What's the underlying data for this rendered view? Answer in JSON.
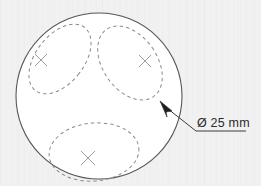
{
  "drawing": {
    "title": "Circular plate with three dashed pocket outlines",
    "background_color": "#f1f1f1",
    "line_color": "#555555",
    "dashed_color": "#8a8a8a",
    "center_mark_color": "#9a9a9a",
    "leader_color": "#3a3a3a",
    "text_color": "#2b2b2b"
  },
  "outer_circle": {
    "name": "plate-outline",
    "cx": 99,
    "cy": 96,
    "r": 83,
    "style": "solid"
  },
  "features": [
    {
      "id": "pocket-upper-left",
      "shape": "ellipse",
      "cx": 60,
      "cy": 59,
      "rx": 24,
      "ry": 40,
      "rotation_deg": 38,
      "style": "dashed",
      "center_mark": {
        "x": 41,
        "y": 60,
        "size": 6
      }
    },
    {
      "id": "pocket-upper-right",
      "shape": "ellipse",
      "cx": 130,
      "cy": 63,
      "rx": 27,
      "ry": 41,
      "rotation_deg": -35,
      "style": "dashed",
      "center_mark": {
        "x": 145,
        "y": 61,
        "size": 6
      }
    },
    {
      "id": "pocket-bottom",
      "shape": "ellipse",
      "cx": 94,
      "cy": 152,
      "rx": 45,
      "ry": 29,
      "rotation_deg": -5,
      "style": "dashed",
      "center_mark": {
        "x": 88,
        "y": 158,
        "size": 7
      }
    }
  ],
  "leader": {
    "name": "diameter-leader",
    "arrow_tip": {
      "x": 161,
      "y": 103
    },
    "elbow": {
      "x": 196,
      "y": 131
    },
    "end": {
      "x": 246,
      "y": 131
    }
  },
  "annotations": {
    "diameter_label": "Ø 25 mm",
    "diameter_label_x": 197,
    "diameter_label_y": 126
  }
}
